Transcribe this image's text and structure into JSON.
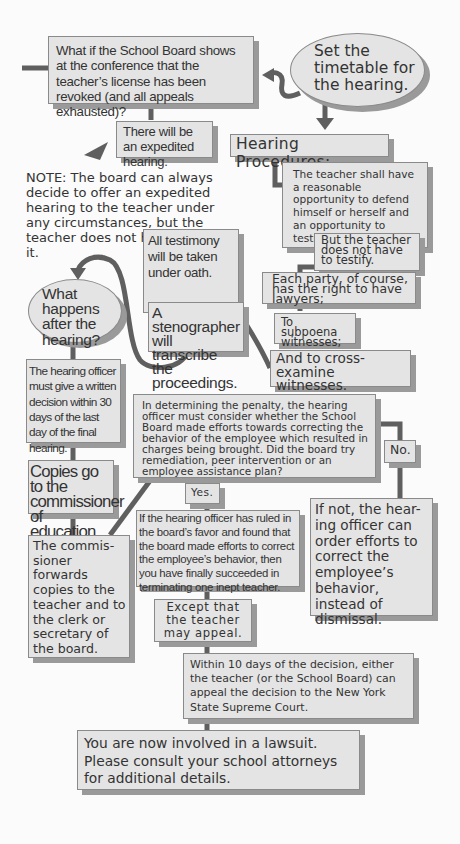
{
  "flowchart": {
    "top_question": "What if the School Board shows at the conference that the teacher’s license has been revoked (and all appeals exhausted)?",
    "set_timetable": "Set the timetable for the hearing.",
    "expedited_hearing": "There will be an expedited hearing.",
    "hearing_procedures_title": "Hearing Procedures:",
    "note": "NOTE: The board can always decide to offer an expedited hearing to the teacher under any circumstances, but the teacher does not have to accept it.",
    "teacher_defend": "The teacher shall have a reasonable opportunity to defend himself or herself and an opportunity to testify.",
    "not_testify": "But the teacher does not have to testify.",
    "testimony_oath": "All testimony will be taken under oath.",
    "lawyers": "Each party, of course, has the right to have lawyers;",
    "subpoena": "To subpoena witnesses;",
    "cross_examine": "And to cross-examine witnesses.",
    "what_happens_after": "What happens after the hearing?",
    "stenographer": "A stenographer will transcribe the proceedings.",
    "written_decision": "The hearing officer must give a written decision within 30 days of the last day of the final hearing.",
    "penalty_question": "In determining the penalty, the hearing officer must consider whether the School Board made efforts towards correcting the behavior of the employee which resulted in charges being brought.  Did the board try remediation, peer intervention or an employee assistance plan?",
    "no_label": "No.",
    "yes_label": "Yes.",
    "copies_commissioner": "Copies go to the commissioner of education.",
    "if_not": "If not, the hear-ing officer can order efforts to correct the employee’s behavior, instead of dismissal.",
    "ruled_favor": "If the hearing officer has ruled in the board’s favor and found that the board made efforts to correct the employee’s behavior, then you have finally succeeded in terminating one inept teacher.",
    "commissioner_forwards": "The commis-sioner forwards copies to the teacher and to the clerk or secretary of the board.",
    "may_appeal": "Except that the teacher may appeal.",
    "ten_days_appeal": "Within 10 days of the decision, either the teacher (or the School Board) can appeal the decision to the New York State Supreme Court.",
    "lawsuit": "You are now involved in a lawsuit. Please consult your school attorneys for additional details."
  },
  "colors": {
    "box_fill": "#e4e4e4",
    "box_border": "#8a8a8a",
    "shadow": "#9a9a9a",
    "connector": "#5f5f5f",
    "text": "#333333",
    "background": "#fbfbfb"
  }
}
